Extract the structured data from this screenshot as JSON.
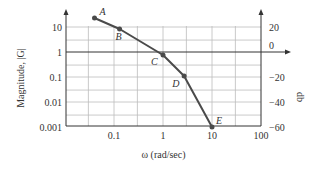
{
  "chart_data": {
    "type": "line",
    "title": "",
    "xlabel": "ω (rad/sec)",
    "ylabel": "Magnitude, |G|",
    "y2label": "db",
    "xscale": "log",
    "yscale": "log",
    "xlim": [
      0.01,
      100
    ],
    "ylim": [
      0.001,
      30
    ],
    "x_ticks": [
      "0.1",
      "1",
      "10",
      "100"
    ],
    "y_ticks": [
      "10",
      "1",
      "0.1",
      "0.01",
      "0.001"
    ],
    "y2_ticks": [
      "20",
      "0",
      "−20",
      "−40",
      "−60"
    ],
    "grid": true,
    "series": [
      {
        "name": "|G|",
        "points": [
          {
            "label": "A",
            "x": 0.04,
            "y": 23
          },
          {
            "label": "B",
            "x": 0.13,
            "y": 8.3
          },
          {
            "label": "C",
            "x": 1.0,
            "y": 0.76
          },
          {
            "label": "D",
            "x": 2.7,
            "y": 0.11
          },
          {
            "label": "E",
            "x": 10,
            "y": 0.001
          }
        ]
      }
    ],
    "colors": {
      "curve": "#4a4a4a",
      "grid": "#bdbdbd",
      "axis": "#333333"
    }
  }
}
